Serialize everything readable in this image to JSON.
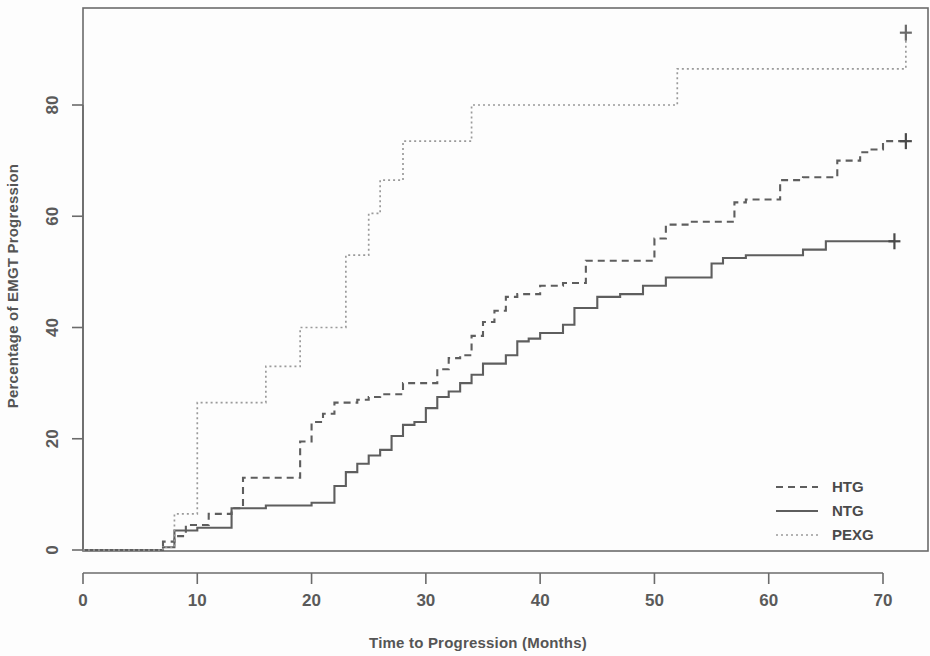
{
  "figure": {
    "title": "",
    "background": "#fdfdfd",
    "width": 930,
    "height": 656
  },
  "axes": {
    "x_label": "Time to Progression (Months)",
    "y_label": "Percentage of EMGT Progression",
    "x_ticks": [
      "0",
      "10",
      "20",
      "30",
      "40",
      "50",
      "60",
      "70"
    ],
    "y_ticks": [
      "0",
      "20",
      "40",
      "60",
      "80"
    ]
  },
  "legend": {
    "position": "bottom-right",
    "entries": [
      {
        "label": "HTG",
        "style": "dashed",
        "color": "#5e5e5e"
      },
      {
        "label": "NTG",
        "style": "solid",
        "color": "#5e5e5e"
      },
      {
        "label": "PEXG",
        "style": "dotted",
        "color": "#9a9a9a"
      }
    ]
  },
  "chart_data": {
    "type": "line",
    "subtype": "kaplan-meier-cumulative-incidence-step",
    "title": "",
    "xlabel": "Time to Progression (Months)",
    "ylabel": "Percentage of EMGT Progression",
    "xlim": [
      -1.5,
      74
    ],
    "ylim": [
      -3,
      96
    ],
    "x_ticks": [
      0,
      10,
      20,
      30,
      40,
      50,
      60,
      70
    ],
    "y_ticks": [
      0,
      20,
      40,
      60,
      80
    ],
    "grid": false,
    "legend_position": "bottom-right",
    "series": [
      {
        "name": "HTG",
        "style": "dashed",
        "color": "#5e5e5e",
        "x": [
          0,
          7,
          8,
          9,
          11,
          13,
          14,
          18,
          19,
          20,
          21,
          22,
          24,
          25,
          26,
          27,
          28,
          30,
          31,
          32,
          33,
          34,
          35,
          36,
          37,
          38,
          40,
          42,
          44,
          46,
          47,
          49,
          50,
          51,
          53,
          55,
          57,
          58,
          60,
          61,
          63,
          65,
          66,
          68,
          69,
          70,
          71,
          72
        ],
        "y": [
          0,
          1.5,
          2.5,
          4.5,
          6.5,
          7.5,
          13,
          13,
          19.5,
          23,
          24.5,
          26.5,
          27,
          27.5,
          28,
          28,
          30,
          30,
          32.5,
          34.5,
          35,
          38.5,
          41,
          43,
          45.5,
          46,
          47.5,
          48,
          52,
          52,
          52,
          52,
          56,
          58.5,
          59,
          59,
          62.5,
          63,
          63,
          66.5,
          67,
          67,
          70,
          71.5,
          72,
          73.5,
          73.5,
          73.5
        ],
        "censored": [
          {
            "x": 72,
            "y": 73.5
          }
        ]
      },
      {
        "name": "NTG",
        "style": "solid",
        "color": "#5e5e5e",
        "x": [
          0,
          7,
          8,
          10,
          12,
          13,
          16,
          18,
          20,
          22,
          23,
          24,
          25,
          26,
          27,
          28,
          29,
          30,
          31,
          32,
          33,
          34,
          35,
          36,
          37,
          38,
          39,
          40,
          41,
          42,
          43,
          44,
          45,
          47,
          49,
          51,
          53,
          55,
          56,
          58,
          60,
          61,
          63,
          65,
          67,
          69,
          70,
          71
        ],
        "y": [
          0,
          0.5,
          3.5,
          4,
          4,
          7.5,
          8,
          8,
          8.5,
          11.5,
          14,
          15.5,
          17,
          18,
          20.5,
          22.5,
          23,
          25.5,
          27.5,
          28.5,
          30,
          31.5,
          33.5,
          33.5,
          35,
          37.5,
          38,
          39,
          39,
          40.5,
          43.5,
          43.5,
          45.5,
          46,
          47.5,
          49,
          49,
          51.5,
          52.5,
          53,
          53,
          53,
          54,
          55.5,
          55.5,
          55.5,
          55.5,
          55.5
        ],
        "censored": [
          {
            "x": 71,
            "y": 55.5
          }
        ]
      },
      {
        "name": "PEXG",
        "style": "dotted",
        "color": "#9a9a9a",
        "x": [
          0,
          7,
          8,
          9,
          10,
          13,
          16,
          17,
          19,
          21,
          23,
          24,
          25,
          26,
          28,
          31,
          34,
          35,
          51,
          52,
          71,
          72
        ],
        "y": [
          0,
          0.5,
          6.5,
          6.5,
          26.5,
          26.5,
          33,
          33,
          40,
          40,
          53,
          53,
          60.5,
          66.5,
          73.5,
          73.5,
          80,
          80,
          80,
          86.5,
          86.5,
          93
        ],
        "censored": [
          {
            "x": 72,
            "y": 93
          }
        ]
      }
    ]
  }
}
